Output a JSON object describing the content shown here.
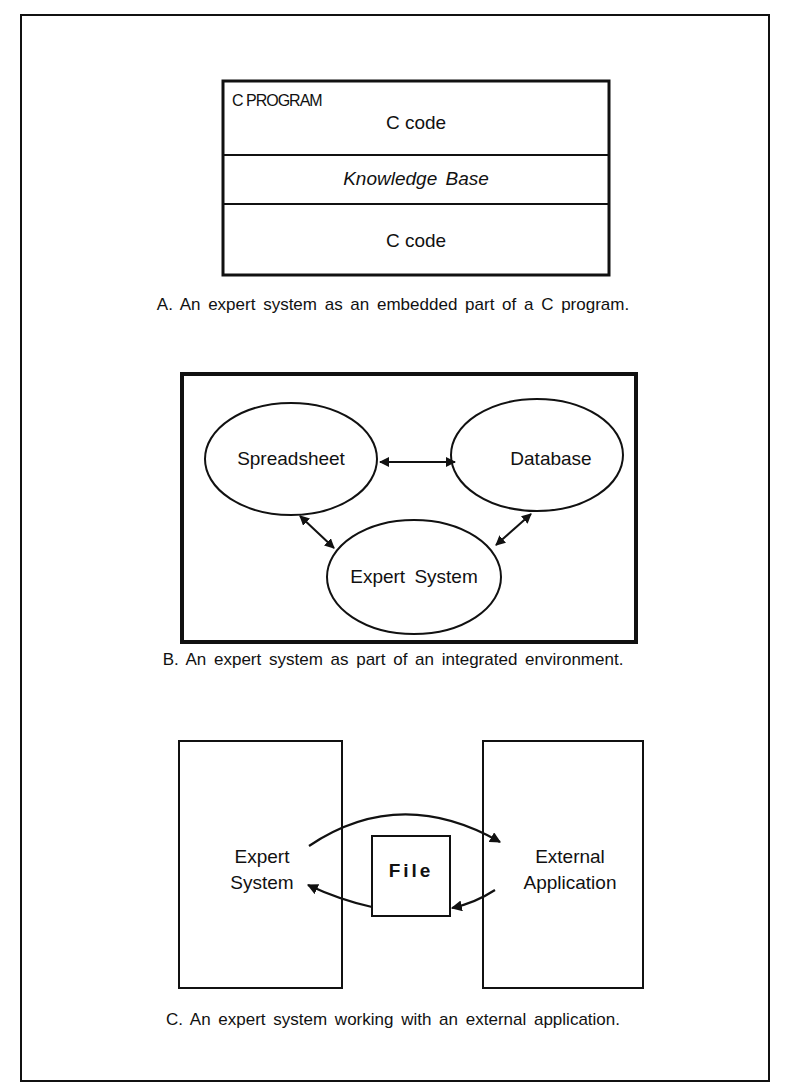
{
  "figure": {
    "panels": [
      {
        "id": "A",
        "caption": "A. An expert system as an embedded part of a C program.",
        "container_label": "C PROGRAM",
        "layers": [
          "C code",
          "Knowledge Base",
          "C code"
        ]
      },
      {
        "id": "B",
        "caption": "B. An expert system as part of an integrated environment.",
        "nodes": [
          "Spreadsheet",
          "Database",
          "Expert System"
        ],
        "edges": [
          {
            "from": "Spreadsheet",
            "to": "Database",
            "direction": "both"
          },
          {
            "from": "Spreadsheet",
            "to": "Expert System",
            "direction": "both"
          },
          {
            "from": "Database",
            "to": "Expert System",
            "direction": "both"
          }
        ]
      },
      {
        "id": "C",
        "caption": "C. An expert system working with an external application.",
        "left_box": {
          "line1": "Expert",
          "line2": "System"
        },
        "center_box": "File",
        "right_box": {
          "line1": "External",
          "line2": "Application"
        },
        "flows": [
          {
            "from": "Expert System",
            "to": "External Application"
          },
          {
            "from": "External Application",
            "to": "File"
          },
          {
            "from": "File",
            "to": "Expert System"
          }
        ]
      }
    ]
  }
}
